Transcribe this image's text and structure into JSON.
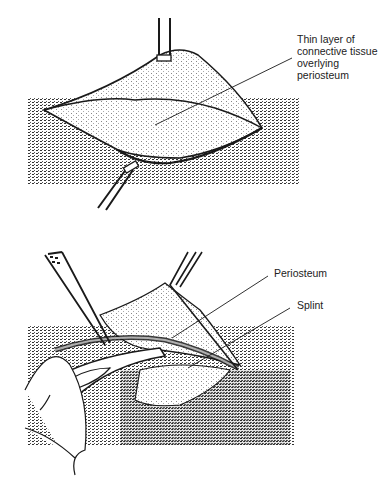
{
  "figure": {
    "panels": [
      {
        "id": "top",
        "description": "Skin flap retracted by two forceps exposing tissue",
        "labels": [
          {
            "text_lines": [
              "Thin layer of",
              "connective tissue",
              "overlying",
              "periosteum"
            ]
          }
        ]
      },
      {
        "id": "bottom",
        "description": "Periosteum lifted with forceps, splint exposed beneath",
        "labels": [
          {
            "text": "Periosteum"
          },
          {
            "text": "Splint"
          }
        ]
      }
    ],
    "colors": {
      "ink": "#1a1a1a",
      "stipple": "#7a7a7a",
      "background": "#ffffff"
    }
  }
}
